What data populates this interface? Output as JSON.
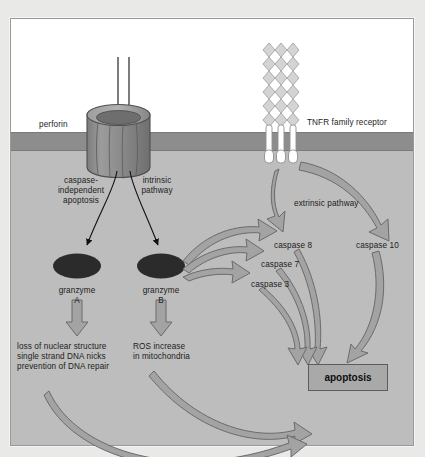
{
  "figure": {
    "title_partial": "",
    "membrane_label": "target cell membrane",
    "background_extracellular": "#ffffff",
    "background_cytoplasm": "#bdbdbd",
    "membrane_color": "#8d8d8d",
    "arrow_fill": "#a3a3a3",
    "arrow_stroke": "#6b6b6b",
    "granzyme_color": "#2b2b2b",
    "perforin_color": "#8f8f8f",
    "receptor_color": "#d2d2d2"
  },
  "labels": {
    "perforin": "perforin",
    "tnfr": "TNFR family receptor",
    "caspase_independent": "caspase-\nindependent\napoptosis",
    "caspase_independent_l1": "caspase-",
    "caspase_independent_l2": "independent",
    "caspase_independent_l3": "apoptosis",
    "intrinsic_l1": "intrinsic",
    "intrinsic_l2": "pathway",
    "extrinsic": "extrinsic pathway",
    "granzyme_a_l1": "granzyme",
    "granzyme_a_l2": "A",
    "granzyme_b_l1": "granzyme",
    "granzyme_b_l2": "B",
    "caspase8": "caspase 8",
    "caspase7": "caspase 7",
    "caspase3": "caspase 3",
    "caspase10": "caspase 10",
    "granzyme_a_effects_l1": "loss of nuclear structure",
    "granzyme_a_effects_l2": "single strand DNA nicks",
    "granzyme_a_effects_l3": "prevention of DNA repair",
    "granzyme_b_effects_l1": "ROS increase",
    "granzyme_b_effects_l2": "in mitochondria",
    "apoptosis": "apoptosis"
  },
  "diagram_data": {
    "type": "diagram",
    "topic": "Cytotoxic lymphocyte killing pathways leading to apoptosis",
    "compartments": [
      "extracellular space",
      "target cell membrane",
      "target cell cytoplasm"
    ],
    "entities": [
      {
        "name": "perforin",
        "kind": "pore",
        "location": "membrane"
      },
      {
        "name": "TNFR family receptor",
        "kind": "receptor",
        "location": "membrane"
      },
      {
        "name": "granzyme A",
        "kind": "protease",
        "location": "cytoplasm"
      },
      {
        "name": "granzyme B",
        "kind": "protease",
        "location": "cytoplasm"
      },
      {
        "name": "caspase 8",
        "kind": "caspase",
        "location": "cytoplasm"
      },
      {
        "name": "caspase 7",
        "kind": "caspase",
        "location": "cytoplasm"
      },
      {
        "name": "caspase 3",
        "kind": "caspase",
        "location": "cytoplasm"
      },
      {
        "name": "caspase 10",
        "kind": "caspase",
        "location": "cytoplasm"
      },
      {
        "name": "apoptosis",
        "kind": "outcome",
        "location": "cytoplasm"
      }
    ],
    "pathways": [
      {
        "name": "caspase-independent apoptosis",
        "from": "perforin",
        "to": "granzyme A"
      },
      {
        "name": "intrinsic pathway",
        "from": "perforin",
        "to": "granzyme B"
      },
      {
        "name": "extrinsic pathway",
        "from": "TNFR family receptor",
        "to": "caspase 8"
      },
      {
        "name": "extrinsic pathway",
        "from": "TNFR family receptor",
        "to": "caspase 10"
      }
    ],
    "edges": [
      {
        "from": "granzyme A",
        "to": "loss of nuclear structure / single strand DNA nicks / prevention of DNA repair"
      },
      {
        "from": "granzyme B",
        "to": "ROS increase in mitochondria"
      },
      {
        "from": "granzyme B",
        "to": "caspase 8"
      },
      {
        "from": "granzyme B",
        "to": "caspase 7"
      },
      {
        "from": "granzyme B",
        "to": "caspase 3"
      },
      {
        "from": "caspase 8",
        "to": "apoptosis"
      },
      {
        "from": "caspase 7",
        "to": "apoptosis"
      },
      {
        "from": "caspase 3",
        "to": "apoptosis"
      },
      {
        "from": "caspase 10",
        "to": "apoptosis"
      },
      {
        "from": "ROS increase in mitochondria",
        "to": "apoptosis"
      },
      {
        "from": "loss of nuclear structure / single strand DNA nicks / prevention of DNA repair",
        "to": "apoptosis"
      }
    ]
  }
}
